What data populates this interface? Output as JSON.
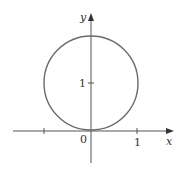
{
  "diagram": {
    "type": "circle-on-axes",
    "axes": {
      "x_label": "x",
      "y_label": "y",
      "origin_label": "0",
      "x_tick_label": "1",
      "y_tick_label": "1"
    },
    "circle": {
      "center": [
        0,
        1
      ],
      "radius": 1,
      "stroke_color": "#6b6b6b"
    },
    "axis_color": "#555555"
  }
}
